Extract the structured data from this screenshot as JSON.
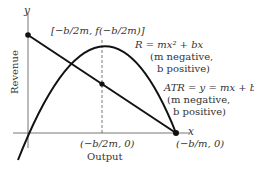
{
  "diagram": {
    "axis_y_label": "y",
    "axis_x_label": "x",
    "y_title": "Revenue",
    "x_title": "Output",
    "vertex_label": "[−b/2m, f(−b/2m)]",
    "revenue_eq": "R = mx² + bx",
    "revenue_note1": "(m negative,",
    "revenue_note2": "b positive)",
    "atr_eq": "ATR = y = mx + b",
    "atr_note1": "(m negative,",
    "atr_note2": "b positive)",
    "midpoint_label": "(−b/2m, 0)",
    "intercept_label": "(−b/m, 0)",
    "colors": {
      "line": "#111111",
      "axis": "#666666",
      "text": "#333333"
    }
  }
}
